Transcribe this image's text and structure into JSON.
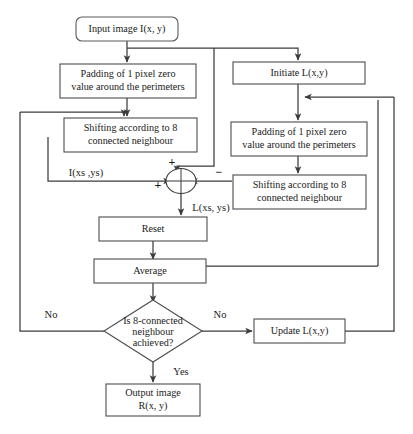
{
  "diagram": {
    "type": "flowchart",
    "nodes": {
      "input": {
        "label": "Input image I(x, y)",
        "shape": "rounded-rect"
      },
      "pad_left": {
        "line1": "Padding of 1 pixel zero",
        "line2": "value around the perimeters",
        "shape": "rect"
      },
      "shift_left": {
        "line1": "Shifting according to 8",
        "line2": "connected neighbour",
        "shape": "rect"
      },
      "initiate": {
        "label": "Initiate L(x,y)",
        "shape": "rect"
      },
      "pad_right": {
        "line1": "Padding of 1 pixel zero",
        "line2": "value around the perimeters",
        "shape": "rect"
      },
      "shift_right": {
        "line1": "Shifting according to 8",
        "line2": "connected neighbour",
        "shape": "rect"
      },
      "sum": {
        "label": "summing-junction",
        "shape": "circle"
      },
      "reset": {
        "label": "Reset",
        "shape": "rect"
      },
      "average": {
        "label": "Average",
        "shape": "rect"
      },
      "decision": {
        "line1": "Is 8-connected",
        "line2": "neighbour",
        "line3": "achieved?",
        "shape": "diamond"
      },
      "update": {
        "label": "Update L(x,y)",
        "shape": "rect"
      },
      "output": {
        "line1": "Output image",
        "line2": "R(x, y)",
        "shape": "rect"
      }
    },
    "edge_labels": {
      "i_signal": "I(xs ,ys)",
      "l_signal": "L(xs, ys)",
      "sign_top": "+",
      "sign_left": "+",
      "sign_right": "−",
      "no_left": "No",
      "no_right": "No",
      "yes": "Yes"
    },
    "colors": {
      "background": "#ffffff",
      "stroke": "#3c3c3c",
      "box_stroke": "#4d4d4d",
      "text": "#1a1a1a"
    }
  }
}
